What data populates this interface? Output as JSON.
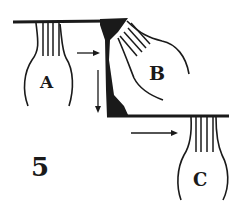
{
  "figure": {
    "panel_number": "5",
    "cells": [
      {
        "id": "A",
        "label": "A"
      },
      {
        "id": "B",
        "label": "B"
      },
      {
        "id": "C",
        "label": "C"
      }
    ],
    "colors": {
      "ink": "#1a1a1a",
      "background": "#ffffff"
    }
  }
}
